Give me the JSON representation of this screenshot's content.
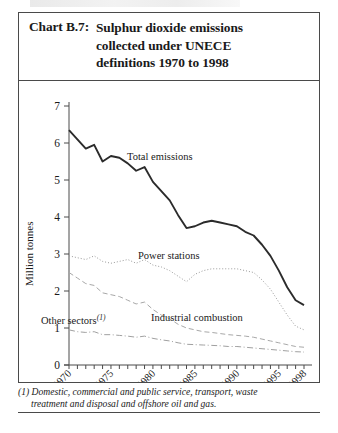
{
  "title": {
    "label": "Chart B.7:",
    "line1": "Sulphur dioxide emissions",
    "line2": "collected under UNECE",
    "line3": "definitions 1970 to 1998"
  },
  "axes": {
    "ylabel": "Million tonnes",
    "yticks": [
      "0",
      "1",
      "2",
      "3",
      "4",
      "5",
      "6",
      "7"
    ],
    "xticks": [
      "1970",
      "1975",
      "1980",
      "1985",
      "1990",
      "1995",
      "1998"
    ]
  },
  "series_labels": {
    "total": "Total emissions",
    "power": "Power stations",
    "industrial": "Industrial combustion",
    "other": "Other sectors",
    "other_footnote_marker": "(1)"
  },
  "footnote": {
    "line1": "(1) Domestic, commercial and public service, transport, waste",
    "line2": "treatment and disposal and offshore oil and gas."
  },
  "colors": {
    "total": "#2b2b2b",
    "power": "#9a9a9a",
    "industrial": "#a8a8a8",
    "other": "#a0a0a0",
    "axis": "#4a4a4a",
    "border": "#4a4a4a"
  },
  "chart_data": {
    "type": "line",
    "title": "Chart B.7: Sulphur dioxide emissions collected under UNECE definitions 1970 to 1998",
    "xlabel": "",
    "ylabel": "Million tonnes",
    "xlim": [
      1970,
      1998
    ],
    "ylim": [
      0,
      7
    ],
    "grid": false,
    "legend": "inline-annotations",
    "x": [
      1970,
      1971,
      1972,
      1973,
      1974,
      1975,
      1976,
      1977,
      1978,
      1979,
      1980,
      1981,
      1982,
      1983,
      1984,
      1985,
      1986,
      1987,
      1988,
      1989,
      1990,
      1991,
      1992,
      1993,
      1994,
      1995,
      1996,
      1997,
      1998
    ],
    "series": [
      {
        "name": "Total emissions",
        "style": "solid-thick",
        "values": [
          6.35,
          6.1,
          5.85,
          5.95,
          5.5,
          5.65,
          5.6,
          5.45,
          5.25,
          5.35,
          4.95,
          4.7,
          4.45,
          4.05,
          3.7,
          3.75,
          3.85,
          3.9,
          3.85,
          3.8,
          3.75,
          3.6,
          3.5,
          3.25,
          2.95,
          2.55,
          2.1,
          1.75,
          1.62
        ]
      },
      {
        "name": "Power stations",
        "style": "dotted",
        "values": [
          2.95,
          2.9,
          2.85,
          2.95,
          2.8,
          2.75,
          2.8,
          2.85,
          2.75,
          2.85,
          2.7,
          2.65,
          2.55,
          2.4,
          2.25,
          2.45,
          2.55,
          2.6,
          2.6,
          2.6,
          2.6,
          2.55,
          2.5,
          2.3,
          2.05,
          1.7,
          1.35,
          1.05,
          0.95
        ]
      },
      {
        "name": "Industrial combustion",
        "style": "dashed",
        "values": [
          2.5,
          2.35,
          2.2,
          2.15,
          1.95,
          1.9,
          1.85,
          1.75,
          1.65,
          1.7,
          1.5,
          1.35,
          1.25,
          1.1,
          1.0,
          0.95,
          0.9,
          0.88,
          0.85,
          0.82,
          0.8,
          0.78,
          0.75,
          0.7,
          0.65,
          0.6,
          0.55,
          0.5,
          0.48
        ]
      },
      {
        "name": "Other sectors",
        "style": "dash-dot",
        "values": [
          0.95,
          0.9,
          0.88,
          0.9,
          0.82,
          0.82,
          0.8,
          0.78,
          0.75,
          0.78,
          0.72,
          0.68,
          0.65,
          0.6,
          0.56,
          0.55,
          0.54,
          0.53,
          0.52,
          0.5,
          0.5,
          0.48,
          0.46,
          0.44,
          0.42,
          0.4,
          0.38,
          0.36,
          0.35
        ]
      }
    ]
  }
}
